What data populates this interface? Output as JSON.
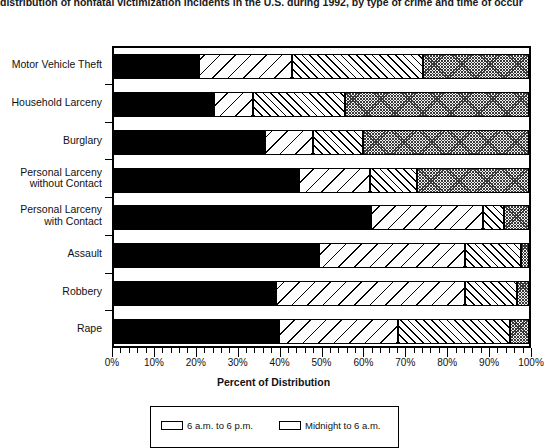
{
  "title": "distribution of nonfatal victimization incidents in the U.S. during 1992, by type of crime and time of occur",
  "axis": {
    "xlabel": "Percent of Distribution",
    "xticks": [
      "0%",
      "10%",
      "20%",
      "30%",
      "40%",
      "50%",
      "60%",
      "70%",
      "80%",
      "90%",
      "100%"
    ]
  },
  "legend": {
    "items": [
      {
        "label": "6 a.m. to 6 p.m.",
        "pattern": "solid-black"
      },
      {
        "label": "Midnight to 6 a.m.",
        "pattern": "gray-crosshatch"
      }
    ]
  },
  "chart_data": {
    "type": "bar",
    "orientation": "horizontal",
    "stacked": "100-percent",
    "title": "distribution of nonfatal victimization incidents in the U.S. during 1992, by type of crime and time of occur",
    "xlabel": "Percent of Distribution",
    "ylabel": "",
    "xlim": [
      0,
      100
    ],
    "grid": false,
    "legend_position": "bottom",
    "categories": [
      "Motor Vehicle Theft",
      "Household Larceny",
      "Burglary",
      "Personal Larceny without Contact",
      "Personal Larceny with Contact",
      "Assault",
      "Robbery",
      "Rape"
    ],
    "series": [
      {
        "name": "6 a.m. to 6 p.m.",
        "pattern": "solid-black",
        "values": [
          20.5,
          24.0,
          36.5,
          44.5,
          62.0,
          49.5,
          39.0,
          39.8
        ]
      },
      {
        "name": "6 p.m. to midnight",
        "pattern": "sparse-backslash-hatch",
        "values": [
          22.5,
          9.6,
          11.5,
          17.1,
          27.0,
          35.0,
          45.5,
          28.7
        ]
      },
      {
        "name": "midnight to 6 a.m.",
        "pattern": "dense-forwardslash-hatch",
        "values": [
          31.5,
          22.0,
          12.0,
          11.4,
          5.0,
          13.5,
          12.5,
          27.0
        ]
      },
      {
        "name": "unknown time",
        "pattern": "gray-crosshatch",
        "values": [
          25.5,
          44.4,
          40.0,
          27.0,
          6.0,
          2.0,
          3.0,
          4.5
        ]
      }
    ]
  }
}
